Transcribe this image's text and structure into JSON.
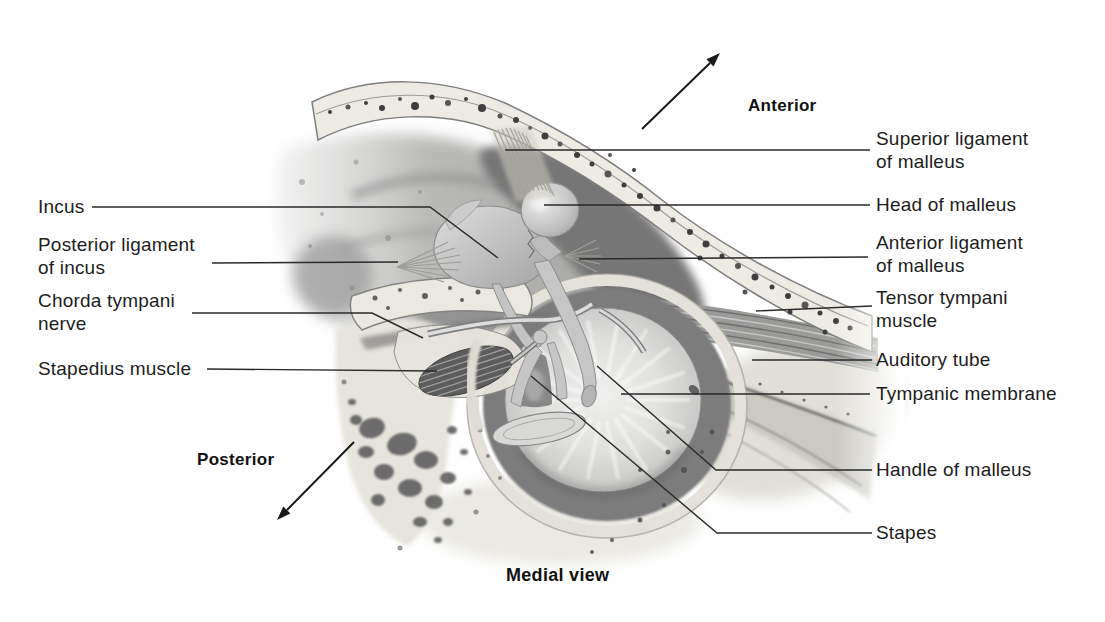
{
  "figure": {
    "caption": "Medial view",
    "orientation": {
      "anterior": "Anterior",
      "posterior": "Posterior"
    },
    "labels_left": [
      {
        "id": "incus",
        "lines": [
          "Incus"
        ]
      },
      {
        "id": "posterior-ligament-of-incus",
        "lines": [
          "Posterior ligament",
          "of incus"
        ]
      },
      {
        "id": "chorda-tympani-nerve",
        "lines": [
          "Chorda tympani",
          "nerve"
        ]
      },
      {
        "id": "stapedius-muscle",
        "lines": [
          "Stapedius muscle"
        ]
      }
    ],
    "labels_right": [
      {
        "id": "superior-ligament-of-malleus",
        "lines": [
          "Superior ligament",
          "of malleus"
        ]
      },
      {
        "id": "head-of-malleus",
        "lines": [
          "Head of malleus"
        ]
      },
      {
        "id": "anterior-ligament-of-malleus",
        "lines": [
          "Anterior ligament",
          "of malleus"
        ]
      },
      {
        "id": "tensor-tympani-muscle",
        "lines": [
          "Tensor tympani",
          "muscle"
        ]
      },
      {
        "id": "auditory-tube",
        "lines": [
          "Auditory tube"
        ]
      },
      {
        "id": "tympanic-membrane",
        "lines": [
          "Tympanic membrane"
        ]
      },
      {
        "id": "handle-of-malleus",
        "lines": [
          "Handle of malleus"
        ]
      },
      {
        "id": "stapes",
        "lines": [
          "Stapes"
        ]
      }
    ],
    "colors": {
      "label_text": "#1d1d1d",
      "leader_line": "#2a2a2a",
      "bone_light": "#edebe4",
      "bone_gray": "#aeaeac",
      "cavity_dark": "#767676",
      "background": "#ffffff"
    }
  }
}
